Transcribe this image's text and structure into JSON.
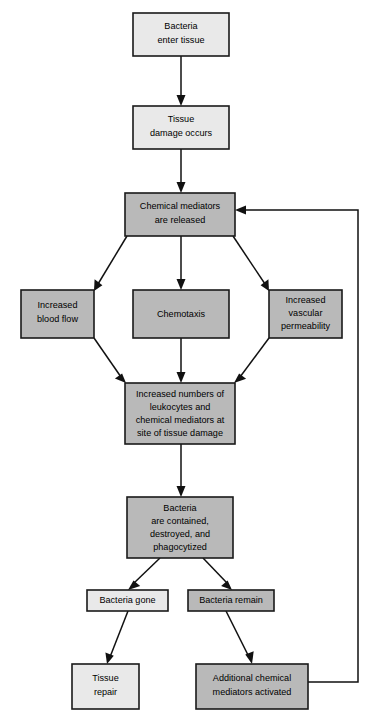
{
  "diagram": {
    "colors": {
      "fill_light": "#e9e9e9",
      "fill_dark": "#b9b9b9",
      "stroke": "#1a1a1a",
      "background": "#ffffff",
      "edge": "#111111"
    },
    "nodes": [
      {
        "id": "bacteria-enter-tissue",
        "lines": [
          "Bacteria",
          "enter tissue"
        ],
        "shade": "light",
        "x": 133,
        "y": 13,
        "w": 96,
        "h": 43
      },
      {
        "id": "tissue-damage-occurs",
        "lines": [
          "Tissue",
          "damage occurs"
        ],
        "shade": "light",
        "x": 133,
        "y": 106,
        "w": 96,
        "h": 43
      },
      {
        "id": "chemical-mediators-released",
        "lines": [
          "Chemical mediators",
          "are released"
        ],
        "shade": "dark",
        "x": 125,
        "y": 193,
        "w": 110,
        "h": 43
      },
      {
        "id": "increased-blood-flow",
        "lines": [
          "Increased",
          "blood flow"
        ],
        "shade": "dark",
        "x": 21,
        "y": 290,
        "w": 73,
        "h": 48
      },
      {
        "id": "chemotaxis",
        "lines": [
          "Chemotaxis"
        ],
        "shade": "dark",
        "x": 133,
        "y": 290,
        "w": 96,
        "h": 48
      },
      {
        "id": "increased-vascular-permeability",
        "lines": [
          "Increased",
          "vascular",
          "permeability"
        ],
        "shade": "dark",
        "x": 269,
        "y": 290,
        "w": 73,
        "h": 48
      },
      {
        "id": "increased-numbers-leukocytes",
        "lines": [
          "Increased numbers of",
          "leukocytes and",
          "chemical mediators at",
          "site of tissue damage"
        ],
        "shade": "dark",
        "x": 125,
        "y": 383,
        "w": 110,
        "h": 61
      },
      {
        "id": "bacteria-contained-destroyed",
        "lines": [
          "Bacteria",
          "are contained,",
          "destroyed, and",
          "phagocytized"
        ],
        "shade": "dark",
        "x": 127,
        "y": 497,
        "w": 106,
        "h": 61
      },
      {
        "id": "bacteria-gone",
        "lines": [
          "Bacteria gone"
        ],
        "shade": "light",
        "x": 87,
        "y": 590,
        "w": 81,
        "h": 21
      },
      {
        "id": "bacteria-remain",
        "lines": [
          "Bacteria remain"
        ],
        "shade": "dark",
        "x": 188,
        "y": 590,
        "w": 86,
        "h": 21
      },
      {
        "id": "tissue-repair",
        "lines": [
          "Tissue",
          "repair"
        ],
        "shade": "light",
        "x": 72,
        "y": 664,
        "w": 67,
        "h": 45
      },
      {
        "id": "additional-chemical-mediators-activated",
        "lines": [
          "Additional chemical",
          "mediators activated"
        ],
        "shade": "dark",
        "x": 196,
        "y": 664,
        "w": 112,
        "h": 45
      }
    ],
    "edges": [
      {
        "id": "enter-to-damage",
        "from": "bacteria-enter-tissue",
        "to": "tissue-damage-occurs",
        "kind": "straight-down"
      },
      {
        "id": "damage-to-mediators",
        "from": "tissue-damage-occurs",
        "to": "chemical-mediators-released",
        "kind": "straight-down"
      },
      {
        "id": "mediators-to-blood-flow",
        "from": "chemical-mediators-released",
        "to": "increased-blood-flow",
        "kind": "diagonal-left"
      },
      {
        "id": "mediators-to-chemotaxis",
        "from": "chemical-mediators-released",
        "to": "chemotaxis",
        "kind": "straight-down"
      },
      {
        "id": "mediators-to-permeability",
        "from": "chemical-mediators-released",
        "to": "increased-vascular-permeability",
        "kind": "diagonal-right"
      },
      {
        "id": "blood-flow-to-leukocytes",
        "from": "increased-blood-flow",
        "to": "increased-numbers-leukocytes",
        "kind": "diagonal-right-down"
      },
      {
        "id": "chemotaxis-to-leukocytes",
        "from": "chemotaxis",
        "to": "increased-numbers-leukocytes",
        "kind": "straight-down"
      },
      {
        "id": "permeability-to-leukocytes",
        "from": "increased-vascular-permeability",
        "to": "increased-numbers-leukocytes",
        "kind": "diagonal-left-down"
      },
      {
        "id": "leukocytes-to-contained",
        "from": "increased-numbers-leukocytes",
        "to": "bacteria-contained-destroyed",
        "kind": "straight-down"
      },
      {
        "id": "contained-to-gone",
        "from": "bacteria-contained-destroyed",
        "to": "bacteria-gone",
        "kind": "diagonal-left-down"
      },
      {
        "id": "contained-to-remain",
        "from": "bacteria-contained-destroyed",
        "to": "bacteria-remain",
        "kind": "diagonal-right-down"
      },
      {
        "id": "gone-to-repair",
        "from": "bacteria-gone",
        "to": "tissue-repair",
        "kind": "diagonal-left-down"
      },
      {
        "id": "remain-to-additional",
        "from": "bacteria-remain",
        "to": "additional-chemical-mediators-activated",
        "kind": "diagonal-right-down"
      },
      {
        "id": "feedback-loop",
        "from": "additional-chemical-mediators-activated",
        "to": "chemical-mediators-released",
        "kind": "feedback-right-up"
      }
    ]
  }
}
